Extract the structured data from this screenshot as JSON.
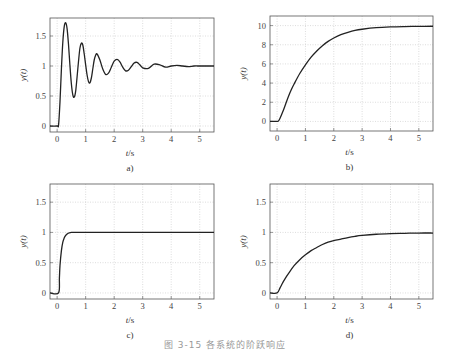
{
  "figure": {
    "caption": "图 3-15  各系统的阶跃响应"
  },
  "chart_data": [
    {
      "id": "a",
      "type": "line",
      "panel_label": "a)",
      "title": "",
      "xlabel": "t/s",
      "ylabel": "y(t)",
      "xlim": [
        -0.25,
        5.5
      ],
      "ylim": [
        -0.1,
        1.8
      ],
      "xticks": [
        0,
        1,
        2,
        3,
        4,
        5
      ],
      "yticks": [
        0,
        0.5,
        1,
        1.5
      ],
      "ytick_labels": [
        "0",
        "0.5",
        "1",
        "1.5"
      ],
      "grid": true,
      "series": [
        {
          "name": "underdamped step response",
          "x": [
            -0.25,
            0,
            0.05,
            0.1,
            0.15,
            0.2,
            0.25,
            0.3,
            0.35,
            0.4,
            0.45,
            0.5,
            0.55,
            0.6,
            0.65,
            0.7,
            0.75,
            0.8,
            0.85,
            0.9,
            0.95,
            1.0,
            1.05,
            1.1,
            1.15,
            1.2,
            1.25,
            1.3,
            1.35,
            1.4,
            1.5,
            1.6,
            1.7,
            1.8,
            1.9,
            2.0,
            2.1,
            2.2,
            2.3,
            2.4,
            2.5,
            2.6,
            2.7,
            2.8,
            2.9,
            3.0,
            3.2,
            3.4,
            3.6,
            3.8,
            4.0,
            4.2,
            4.4,
            4.6,
            4.8,
            5.0,
            5.2,
            5.5
          ],
          "y": [
            0,
            0,
            0.02,
            0.4,
            0.95,
            1.4,
            1.66,
            1.72,
            1.62,
            1.35,
            1.0,
            0.7,
            0.52,
            0.48,
            0.58,
            0.82,
            1.08,
            1.3,
            1.38,
            1.35,
            1.2,
            1.02,
            0.85,
            0.74,
            0.72,
            0.8,
            0.95,
            1.1,
            1.18,
            1.2,
            1.1,
            0.95,
            0.86,
            0.88,
            0.98,
            1.08,
            1.11,
            1.07,
            0.98,
            0.92,
            0.93,
            0.99,
            1.05,
            1.06,
            1.02,
            0.97,
            0.96,
            1.03,
            1.02,
            0.98,
            1.0,
            1.01,
            1.0,
            0.99,
            1.0,
            1.0,
            1.0,
            1.0
          ]
        }
      ]
    },
    {
      "id": "b",
      "type": "line",
      "panel_label": "b)",
      "title": "",
      "xlabel": "t/s",
      "ylabel": "y(t)",
      "xlim": [
        -0.25,
        5.5
      ],
      "ylim": [
        -1,
        11
      ],
      "xticks": [
        0,
        1,
        2,
        3,
        4,
        5
      ],
      "yticks": [
        0,
        2,
        4,
        6,
        8,
        10
      ],
      "ytick_labels": [
        "0",
        "2",
        "4",
        "6",
        "8",
        "10"
      ],
      "grid": true,
      "series": [
        {
          "name": "first-order step response (gain 10)",
          "x": [
            -0.25,
            0,
            0.05,
            0.1,
            0.2,
            0.3,
            0.4,
            0.5,
            0.6,
            0.8,
            1.0,
            1.2,
            1.4,
            1.6,
            1.8,
            2.0,
            2.25,
            2.5,
            2.75,
            3.0,
            3.5,
            4.0,
            4.5,
            5.0,
            5.5
          ],
          "y": [
            0,
            0,
            0.05,
            0.3,
            1.0,
            1.8,
            2.6,
            3.3,
            3.9,
            5.0,
            5.9,
            6.7,
            7.35,
            7.9,
            8.35,
            8.7,
            9.05,
            9.3,
            9.5,
            9.62,
            9.78,
            9.86,
            9.9,
            9.92,
            9.93
          ]
        }
      ]
    },
    {
      "id": "c",
      "type": "line",
      "panel_label": "c)",
      "title": "",
      "xlabel": "t/s",
      "ylabel": "y(t)",
      "xlim": [
        -0.25,
        5.5
      ],
      "ylim": [
        -0.1,
        1.8
      ],
      "xticks": [
        0,
        1,
        2,
        3,
        4,
        5
      ],
      "yticks": [
        0,
        0.5,
        1,
        1.5
      ],
      "ytick_labels": [
        "0",
        "0.5",
        "1",
        "1.5"
      ],
      "grid": true,
      "series": [
        {
          "name": "fast step response",
          "x": [
            -0.25,
            0.05,
            0.08,
            0.1,
            0.15,
            0.2,
            0.25,
            0.3,
            0.35,
            0.4,
            0.45,
            0.5,
            0.6,
            0.8,
            1.0,
            2.0,
            3.0,
            4.0,
            5.0,
            5.5
          ],
          "y": [
            0,
            0,
            0.25,
            0.45,
            0.7,
            0.84,
            0.91,
            0.95,
            0.975,
            0.99,
            0.995,
            1.0,
            1.0,
            1.0,
            1.0,
            1.0,
            1.0,
            1.0,
            1.0,
            1.0
          ]
        }
      ]
    },
    {
      "id": "d",
      "type": "line",
      "panel_label": "d)",
      "title": "",
      "xlabel": "t/s",
      "ylabel": "y(t)",
      "xlim": [
        -0.25,
        5.5
      ],
      "ylim": [
        -0.1,
        1.8
      ],
      "xticks": [
        0,
        1,
        2,
        3,
        4,
        5
      ],
      "yticks": [
        0,
        0.5,
        1,
        1.5
      ],
      "ytick_labels": [
        "0",
        "0.5",
        "1",
        "1.5"
      ],
      "grid": true,
      "series": [
        {
          "name": "first-order step response (gain 1)",
          "x": [
            -0.25,
            0,
            0.1,
            0.2,
            0.3,
            0.4,
            0.6,
            0.8,
            1.0,
            1.2,
            1.4,
            1.6,
            1.8,
            2.0,
            2.25,
            2.5,
            2.75,
            3.0,
            3.5,
            4.0,
            4.5,
            5.0,
            5.5
          ],
          "y": [
            0,
            0,
            0.08,
            0.17,
            0.25,
            0.32,
            0.45,
            0.55,
            0.63,
            0.7,
            0.75,
            0.8,
            0.84,
            0.865,
            0.89,
            0.915,
            0.935,
            0.95,
            0.97,
            0.98,
            0.985,
            0.99,
            0.99
          ]
        }
      ]
    }
  ]
}
